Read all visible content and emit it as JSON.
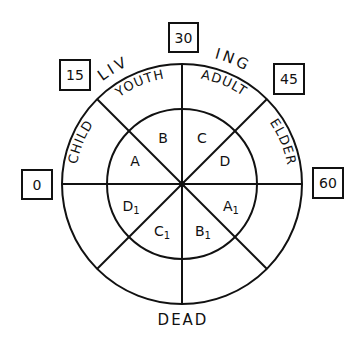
{
  "diagram": {
    "arc_title": {
      "left": "LIV",
      "right": "ING"
    },
    "bottom_label": "DEAD",
    "age_boxes": [
      {
        "id": "age-0",
        "value": "0"
      },
      {
        "id": "age-15",
        "value": "15"
      },
      {
        "id": "age-30",
        "value": "30"
      },
      {
        "id": "age-45",
        "value": "45"
      },
      {
        "id": "age-60",
        "value": "60"
      }
    ],
    "outer_ring": [
      "CHILD",
      "YOUTH",
      "ADULT",
      "ELDER"
    ],
    "inner_upper": [
      "A",
      "B",
      "C",
      "D"
    ],
    "inner_lower": [
      {
        "base": "D",
        "sub": "1"
      },
      {
        "base": "C",
        "sub": "1"
      },
      {
        "base": "B",
        "sub": "1"
      },
      {
        "base": "A",
        "sub": "1"
      }
    ],
    "colors": {
      "ink": "#111111",
      "background": "#ffffff"
    }
  }
}
